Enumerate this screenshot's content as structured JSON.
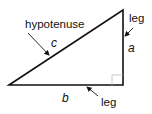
{
  "diagram": {
    "vertices": {
      "left": [
        9,
        85
      ],
      "top": [
        123,
        10
      ],
      "right_angle": [
        123,
        85
      ]
    },
    "labels": {
      "hypotenuse": "hypotenuse",
      "leg_vertical": "leg",
      "leg_horizontal": "leg",
      "side_c": "c",
      "side_a": "a",
      "side_b": "b"
    },
    "colors": {
      "stroke": "#111111",
      "background": "#ffffff",
      "right_angle_mark": "#bbbbbb"
    }
  }
}
